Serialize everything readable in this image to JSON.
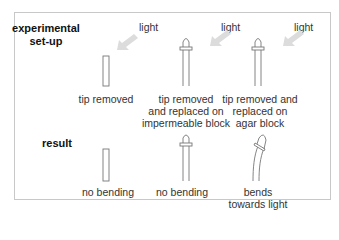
{
  "figure": {
    "row_labels": {
      "setup": [
        "experimental",
        "set-up"
      ],
      "result": "result"
    },
    "light_label": "light",
    "columns": [
      {
        "setup_label": [
          "tip removed"
        ],
        "result_label": [
          "no bending"
        ],
        "has_light": false,
        "has_cap": false,
        "bends": false
      },
      {
        "setup_label": [
          "tip removed",
          "and replaced on",
          "impermeable block"
        ],
        "result_label": [
          "no bending"
        ],
        "has_light": true,
        "has_cap": true,
        "bends": false
      },
      {
        "setup_label": [
          "tip removed and",
          "replaced on",
          "agar block"
        ],
        "result_label": [
          "bends",
          "towards light"
        ],
        "has_light": true,
        "has_cap": true,
        "bends": true
      }
    ],
    "colors": {
      "frame": "#c8c8c8",
      "stem_stroke": "#777777",
      "arrow": "#d9d9d9",
      "text": "#333333"
    }
  }
}
